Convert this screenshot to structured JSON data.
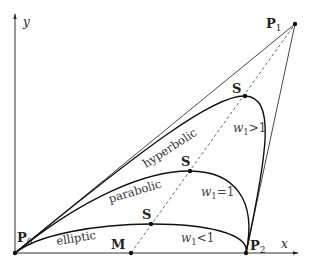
{
  "diagram": {
    "type": "rational quadratic Bezier curves (conic sections)",
    "axes": {
      "x_label": "x",
      "y_label": "y"
    },
    "points": {
      "P0": {
        "label": "P",
        "sub": "0",
        "x": 15,
        "y": 253
      },
      "P1": {
        "label": "P",
        "sub": "1",
        "x": 295,
        "y": 24
      },
      "P2": {
        "label": "P",
        "sub": "2",
        "x": 246,
        "y": 253
      },
      "M": {
        "label": "M",
        "x": 131,
        "y": 253
      }
    },
    "curves": [
      {
        "name": "hyperbolic",
        "label": "hyperbolic",
        "weight_label": "w",
        "weight_sub": "1",
        "weight_rel": ">1",
        "S": {
          "label": "S",
          "x": 245,
          "y": 96
        }
      },
      {
        "name": "parabolic",
        "label": "parabolic",
        "weight_label": "w",
        "weight_sub": "1",
        "weight_rel": "=1",
        "S": {
          "label": "S",
          "x": 190,
          "y": 171
        }
      },
      {
        "name": "elliptic",
        "label": "elliptic",
        "weight_label": "w",
        "weight_sub": "1",
        "weight_rel": "<1",
        "S": {
          "label": "S",
          "x": 151,
          "y": 224
        }
      }
    ]
  }
}
